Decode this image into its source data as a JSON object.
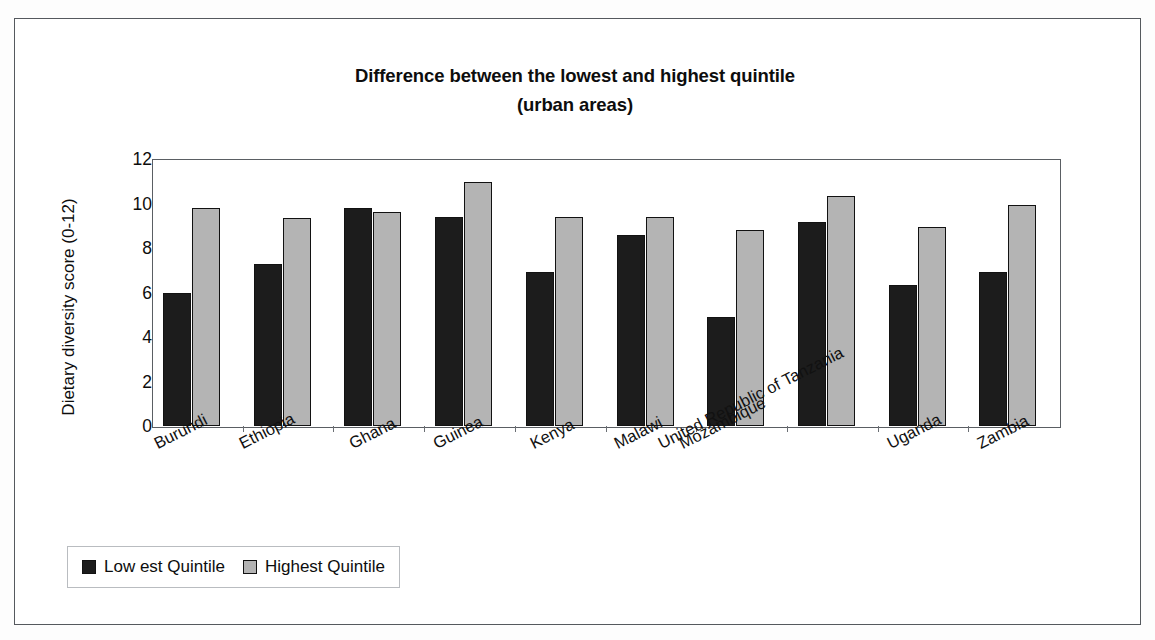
{
  "chart_data": {
    "type": "bar",
    "title": "Difference between the lowest and highest quintile",
    "subtitle": "(urban areas)",
    "xlabel": "",
    "ylabel": "Dietary diversity score (0-12)",
    "ylim": [
      0,
      12
    ],
    "ytick_labels": [
      "12",
      "10",
      "8",
      "6",
      "4",
      "2",
      "0"
    ],
    "ytick_values": [
      12,
      10,
      8,
      6,
      4,
      2,
      0
    ],
    "grid": false,
    "legend_position": "bottom-left",
    "categories": [
      "Burundi",
      "Ethiopia",
      "Ghana",
      "Guinea",
      "Kenya",
      "Malawi",
      "Mozambique",
      "United Republic of Tanzania",
      "Uganda",
      "Zambia"
    ],
    "series": [
      {
        "name": "Low est Quintile",
        "color": "#1c1c1c",
        "values": [
          6.0,
          7.3,
          9.8,
          9.4,
          6.9,
          8.6,
          4.9,
          9.15,
          6.35,
          6.9
        ]
      },
      {
        "name": "Highest Quintile",
        "color": "#b4b4b4",
        "values": [
          9.8,
          9.35,
          9.6,
          10.95,
          9.4,
          9.4,
          8.8,
          10.35,
          8.95,
          9.95
        ]
      }
    ]
  },
  "legend": {
    "items": [
      {
        "label": "Low est Quintile",
        "color": "#1c1c1c"
      },
      {
        "label": "Highest Quintile",
        "color": "#b4b4b4"
      }
    ]
  }
}
